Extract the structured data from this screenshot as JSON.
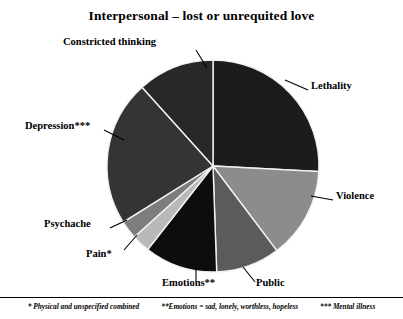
{
  "chart_data": {
    "type": "pie",
    "title": "Interpersonal – lost or unrequited love",
    "xlabel": "",
    "ylabel": "",
    "legend_position": "callout-labels",
    "grid": false,
    "start_angle_deg": 0,
    "direction": "clockwise",
    "categories": [
      "Lethality",
      "Violence",
      "Public",
      "Emotions**",
      "Pain*",
      "Psychache",
      "Depression***",
      "Constricted thinking"
    ],
    "values": [
      25.8,
      13.9,
      9.7,
      11.1,
      2.8,
      2.8,
      22.2,
      11.7
    ],
    "colors": [
      "#1c1c1c",
      "#8c8c8c",
      "#5b5b5b",
      "#0d0d0d",
      "#b9b9b9",
      "#7d7d7d",
      "#343434",
      "#282828"
    ],
    "slices": [
      {
        "label": "Lethality",
        "value": 25.8,
        "start_deg": 0.0,
        "end_deg": 93.0,
        "color": "#1c1c1c"
      },
      {
        "label": "Violence",
        "value": 13.9,
        "start_deg": 93.0,
        "end_deg": 143.0,
        "color": "#8c8c8c"
      },
      {
        "label": "Public",
        "value": 9.7,
        "start_deg": 143.0,
        "end_deg": 178.0,
        "color": "#5b5b5b"
      },
      {
        "label": "Emotions**",
        "value": 11.1,
        "start_deg": 178.0,
        "end_deg": 218.0,
        "color": "#0d0d0d"
      },
      {
        "label": "Pain*",
        "value": 2.8,
        "start_deg": 218.0,
        "end_deg": 228.0,
        "color": "#b9b9b9"
      },
      {
        "label": "Psychache",
        "value": 2.8,
        "start_deg": 228.0,
        "end_deg": 238.0,
        "color": "#7d7d7d"
      },
      {
        "label": "Depression***",
        "value": 22.2,
        "start_deg": 238.0,
        "end_deg": 318.0,
        "color": "#343434"
      },
      {
        "label": "Constricted thinking",
        "value": 11.7,
        "start_deg": 318.0,
        "end_deg": 360.0,
        "color": "#282828"
      }
    ]
  },
  "labels": {
    "constricted_thinking": "Constricted thinking",
    "lethality": "Lethality",
    "violence": "Violence",
    "public": "Public",
    "emotions": "Emotions**",
    "pain": "Pain*",
    "psychache": "Psychache",
    "depression": "Depression***"
  },
  "footnotes": {
    "one": "* Physical and unspecified combined",
    "two": "**Emotions = sad, lonely, worthless, hopeless",
    "three": "*** Mental illness"
  }
}
